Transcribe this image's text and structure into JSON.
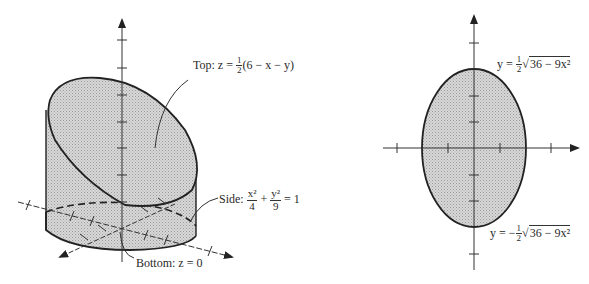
{
  "left_figure": {
    "title": "3D solid: cylinder cut by plane",
    "top_label": {
      "prefix": "Top: z = ",
      "frac_num": "1",
      "frac_den": "2",
      "suffix": "(6 − x − y)"
    },
    "side_label": {
      "prefix": "Side: ",
      "term1_num": "x²",
      "term1_den": "4",
      "plus": "+",
      "term2_num": "y²",
      "term2_den": "9",
      "suffix": "= 1"
    },
    "bottom_label": "Bottom: z = 0",
    "axes": [
      "x",
      "y",
      "z"
    ]
  },
  "right_figure": {
    "title": "Projection onto xy-plane: ellipse",
    "upper_curve_label": {
      "prefix": "y = ",
      "frac_num": "1",
      "frac_den": "2",
      "radical": "√",
      "radicand": "36 − 9x²"
    },
    "lower_curve_label": {
      "prefix": "y = −",
      "frac_num": "1",
      "frac_den": "2",
      "radical": "√",
      "radicand": "36 − 9x²"
    },
    "ellipse": {
      "semi_x": 2,
      "semi_y": 3
    }
  },
  "colors": {
    "fill": "#cfcfcf",
    "stroke": "#222222",
    "axis": "#333333"
  }
}
